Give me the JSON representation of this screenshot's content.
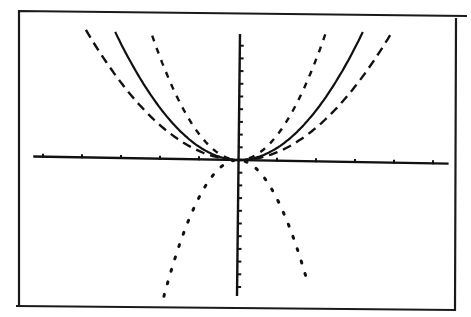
{
  "screen": {
    "description": "Graphing calculator display with four parabolas on common axes",
    "background": "#ffffff",
    "ink": "#111111"
  },
  "chart_data": {
    "type": "line",
    "title": "",
    "xlabel": "",
    "ylabel": "",
    "xlim": [
      -5.5,
      5.5
    ],
    "ylim": [
      -10.5,
      10
    ],
    "x_tick_step": 1,
    "y_tick_step": 1,
    "grid": false,
    "legend": null,
    "series": [
      {
        "name": "y = x^2",
        "style": "solid",
        "coef": 1,
        "x_range": [
          -3.15,
          3.2
        ]
      },
      {
        "name": "y = (2/3)x^2",
        "style": "dashed",
        "coef": 0.66,
        "x_range": [
          -3.9,
          3.9
        ]
      },
      {
        "name": "y = 2x^2",
        "style": "dashed-short",
        "coef": 2.0,
        "x_range": [
          -2.2,
          2.25
        ]
      },
      {
        "name": "y = -3x^2",
        "style": "dotted",
        "coef": -3.0,
        "x_range": [
          -1.9,
          1.8
        ]
      }
    ]
  }
}
